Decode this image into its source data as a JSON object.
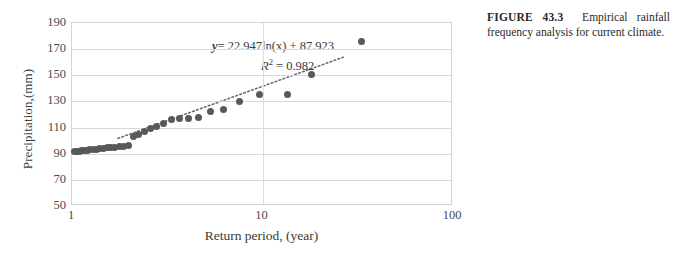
{
  "caption": {
    "label": "FIGURE 43.3",
    "text": "Empirical rainfall frequency analysis for current climate."
  },
  "annotations": {
    "equation_prefix": "y",
    "equation_body": "= 22.947ln(x) + 87.923",
    "r2_symbol": "R",
    "r2_exponent": "2",
    "r2_value": "= 0.982",
    "slope": 22.947,
    "intercept": 87.923,
    "r_squared": 0.982
  },
  "chart_data": {
    "type": "scatter",
    "title": "",
    "xlabel": "Return period, (year)",
    "ylabel": "Precipitation,(mm)",
    "xscale": "log",
    "yscale": "linear",
    "xlim": [
      1,
      100
    ],
    "ylim": [
      50,
      190
    ],
    "xticks": [
      1,
      10,
      100
    ],
    "xtick_labels": [
      "1",
      "10",
      "100"
    ],
    "yticks": [
      50,
      70,
      90,
      110,
      130,
      150,
      170,
      190
    ],
    "ytick_labels": [
      "50",
      "70",
      "90",
      "110",
      "130",
      "150",
      "170",
      "190"
    ],
    "grid": "horizontal-and-vertical",
    "legend": "none",
    "series": [
      {
        "name": "Empirical rainfall",
        "marker": "circle",
        "color": "#595959",
        "points": [
          [
            1.03,
            91.5
          ],
          [
            1.06,
            91.8
          ],
          [
            1.09,
            92.0
          ],
          [
            1.12,
            92.2
          ],
          [
            1.16,
            92.4
          ],
          [
            1.2,
            92.7
          ],
          [
            1.24,
            93.0
          ],
          [
            1.29,
            93.3
          ],
          [
            1.34,
            93.6
          ],
          [
            1.4,
            93.9
          ],
          [
            1.46,
            94.2
          ],
          [
            1.53,
            94.5
          ],
          [
            1.6,
            94.8
          ],
          [
            1.68,
            95.1
          ],
          [
            1.77,
            95.4
          ],
          [
            1.87,
            95.8
          ],
          [
            1.98,
            96.2
          ],
          [
            2.1,
            103.0
          ],
          [
            2.24,
            105.0
          ],
          [
            2.4,
            107.0
          ],
          [
            2.58,
            109.0
          ],
          [
            2.79,
            111.0
          ],
          [
            3.03,
            113.0
          ],
          [
            3.32,
            116.0
          ],
          [
            3.67,
            117.0
          ],
          [
            4.1,
            117.2
          ],
          [
            4.63,
            118.0
          ],
          [
            5.32,
            122.0
          ],
          [
            6.26,
            123.5
          ],
          [
            7.6,
            130.0
          ],
          [
            9.7,
            135.0
          ],
          [
            13.5,
            135.5
          ],
          [
            18.0,
            150.5
          ],
          [
            33.0,
            175.5
          ]
        ]
      }
    ],
    "trendline": {
      "type": "logarithmic",
      "style": "dotted",
      "color": "#6b6b6b",
      "equation": "y = 22.947ln(x) + 87.923",
      "r_squared": 0.982,
      "x_start": 1.75,
      "x_end": 27.0
    }
  }
}
